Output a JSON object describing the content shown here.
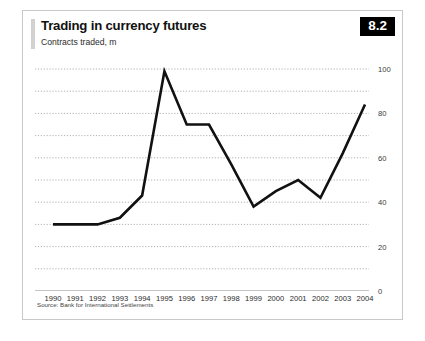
{
  "header": {
    "title": "Trading in currency futures",
    "subtitle": "Contracts traded, m",
    "badge": "8.2"
  },
  "source": "Source: Bank for International Settlements",
  "colors": {
    "line": "#111111",
    "gridline": "#a9a9a9",
    "axis": "#8c8c8c",
    "badge_bg": "#000000",
    "badge_text": "#ffffff",
    "frame": "#c8c8c8",
    "title_rule": "#d2d2d2"
  },
  "chart_data": {
    "type": "line",
    "title": "Trading in currency futures",
    "subtitle": "Contracts traded, m",
    "xlabel": "",
    "ylabel": "Contracts traded, m",
    "categories": [
      "1990",
      "1991",
      "1992",
      "1993",
      "1994",
      "1995",
      "1996",
      "1997",
      "1998",
      "1999",
      "2000",
      "2001",
      "2002",
      "2003",
      "2004"
    ],
    "values": [
      30,
      30,
      30,
      33,
      43,
      99,
      75,
      75,
      57,
      38,
      45,
      50,
      42,
      62,
      84
    ],
    "series": [
      {
        "name": "Contracts traded, m",
        "values": [
          30,
          30,
          30,
          33,
          43,
          99,
          75,
          75,
          57,
          38,
          45,
          50,
          42,
          62,
          84
        ]
      }
    ],
    "ylim": [
      0,
      100
    ],
    "yticks": [
      0,
      20,
      40,
      60,
      80,
      100
    ],
    "ytick_labels": [
      "0",
      "20",
      "40",
      "60",
      "80",
      "100"
    ],
    "gridlines_minor": [
      10,
      30,
      50,
      70,
      90
    ],
    "grid": true,
    "grid_style": "dotted-horizontal",
    "legend": "none",
    "legend_position": "none",
    "annotations": []
  }
}
